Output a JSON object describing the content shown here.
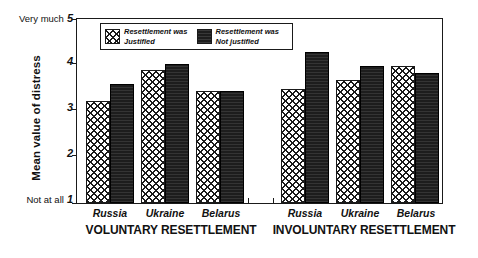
{
  "chart_data": {
    "type": "bar",
    "title": "",
    "xlabel": "",
    "ylabel": "Mean value of distress",
    "ylim": [
      1,
      5
    ],
    "yticks": [
      1,
      2,
      3,
      4,
      5
    ],
    "ytick_labels": [
      "1",
      "2",
      "3",
      "4",
      "5"
    ],
    "y_axis_low_caption": "Not at all",
    "y_axis_high_caption": "Very much",
    "grid": false,
    "legend_position": "top-left inside plot",
    "groups": [
      "VOLUNTARY RESETTLEMENT",
      "INVOLUNTARY RESETTLEMENT"
    ],
    "categories": [
      "Russia",
      "Ukraine",
      "Belarus",
      "Russia",
      "Ukraine",
      "Belarus"
    ],
    "series": [
      {
        "name": "Resettlement was Justified",
        "fill": "cross-hatch",
        "color": "#ffffff",
        "values": [
          3.2,
          3.85,
          3.4,
          3.45,
          3.65,
          3.95
        ]
      },
      {
        "name": "Resettlement was Not justified",
        "fill": "solid-black",
        "color": "#1d1d1d",
        "values": [
          3.55,
          4.0,
          3.4,
          4.25,
          3.95,
          3.8
        ]
      }
    ],
    "panels": [
      {
        "label": "VOLUNTARY RESETTLEMENT",
        "categories": [
          "Russia",
          "Ukraine",
          "Belarus"
        ],
        "justified": [
          3.2,
          3.85,
          3.4
        ],
        "not_justified": [
          3.55,
          4.0,
          3.4
        ]
      },
      {
        "label": "INVOLUNTARY RESETTLEMENT",
        "categories": [
          "Russia",
          "Ukraine",
          "Belarus"
        ],
        "justified": [
          3.45,
          3.65,
          3.95
        ],
        "not_justified": [
          4.25,
          3.95,
          3.8
        ]
      }
    ]
  },
  "legend": {
    "items": [
      {
        "line1": "Resettlement was",
        "line2": "Justified",
        "swatch": "cross-hatch-swatch"
      },
      {
        "line1": "Resettlement was",
        "line2": "Not justified",
        "swatch": "solid-black-swatch"
      }
    ]
  },
  "axis": {
    "y_title": "Mean value of distress",
    "ticks": [
      {
        "value": 5,
        "label": "5",
        "endcap": "Very much"
      },
      {
        "value": 4,
        "label": "4",
        "endcap": ""
      },
      {
        "value": 3,
        "label": "3",
        "endcap": ""
      },
      {
        "value": 2,
        "label": "2",
        "endcap": ""
      },
      {
        "value": 1,
        "label": "1",
        "endcap": "Not at all"
      }
    ]
  },
  "x_labels": {
    "voluntary": [
      "Russia",
      "Ukraine",
      "Belarus"
    ],
    "involuntary": [
      "Russia",
      "Ukraine",
      "Belarus"
    ],
    "group_left": "VOLUNTARY RESETTLEMENT",
    "group_right": "INVOLUNTARY RESETTLEMENT"
  }
}
